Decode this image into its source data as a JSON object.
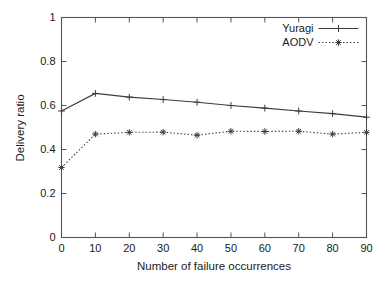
{
  "chart_data": {
    "type": "line",
    "title": "",
    "xlabel": "Number of failure occurrences",
    "ylabel": "Delivery ratio",
    "x": [
      0,
      10,
      20,
      30,
      40,
      50,
      60,
      70,
      80,
      90
    ],
    "xlim": [
      0,
      90
    ],
    "ylim": [
      0,
      1
    ],
    "xticks": [
      "0",
      "10",
      "20",
      "30",
      "40",
      "50",
      "60",
      "70",
      "80",
      "90"
    ],
    "yticks": [
      "0",
      "0.2",
      "0.4",
      "0.6",
      "0.8",
      "1"
    ],
    "ytick_values": [
      0,
      0.2,
      0.4,
      0.6,
      0.8,
      1
    ],
    "grid": false,
    "legend_position": "top-right",
    "series": [
      {
        "name": "Yuragi",
        "style": "solid",
        "marker": "plus",
        "color": "#3c3c3c",
        "values": [
          0.575,
          0.655,
          0.638,
          0.627,
          0.615,
          0.6,
          0.588,
          0.575,
          0.563,
          0.547
        ]
      },
      {
        "name": "AODV",
        "style": "dotted",
        "marker": "star",
        "color": "#3c3c3c",
        "values": [
          0.318,
          0.47,
          0.478,
          0.479,
          0.465,
          0.483,
          0.482,
          0.483,
          0.47,
          0.478
        ]
      }
    ]
  },
  "axes": {
    "frame_color": "#555555"
  },
  "legend": {
    "entries": [
      {
        "label": "Yuragi"
      },
      {
        "label": "AODV"
      }
    ]
  }
}
